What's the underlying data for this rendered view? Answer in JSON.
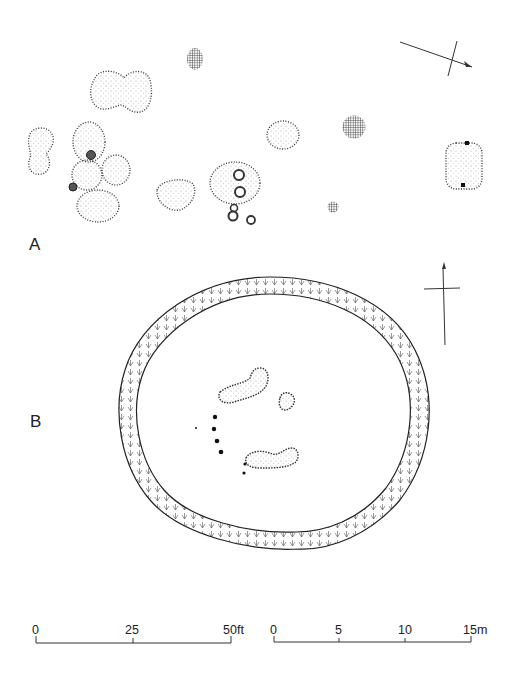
{
  "figure": {
    "panels": [
      {
        "label": "A",
        "description": "Plan of pits and postholes (stippled features)"
      },
      {
        "label": "B",
        "description": "Plan of ring enclosure with central features and posthole line"
      }
    ]
  },
  "scale_feet": {
    "ticks": [
      "0",
      "25",
      "50ft"
    ]
  },
  "scale_metres": {
    "ticks": [
      "0",
      "5",
      "10",
      "15m"
    ]
  },
  "north_arrows": [
    {
      "panel": "A",
      "icon": "north-arrow-icon"
    },
    {
      "panel": "B",
      "icon": "north-arrow-icon"
    }
  ],
  "colors": {
    "ink": "#222222",
    "stipple": "#333333",
    "background": "#ffffff"
  }
}
